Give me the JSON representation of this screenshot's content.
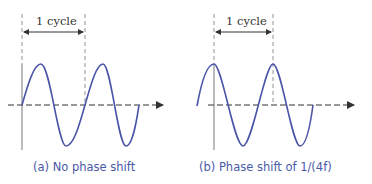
{
  "panels": [
    {
      "id": "a",
      "caption": "(a) No phase shift",
      "cycle_label": "1 cycle",
      "phase_shift": "none"
    },
    {
      "id": "b",
      "caption": "(b) Phase shift of 1/(4f)",
      "cycle_label": "1 cycle",
      "phase_shift": "1/(4f)"
    }
  ],
  "colors": {
    "wave": "#4a54a8",
    "axis": "#555555",
    "caption": "#4a5aa6"
  }
}
